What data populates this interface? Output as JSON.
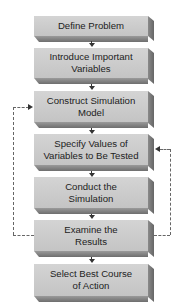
{
  "diagram": {
    "type": "flowchart",
    "steps": [
      {
        "line1": "Define Problem",
        "line2": ""
      },
      {
        "line1": "Introduce Important",
        "line2": "Variables"
      },
      {
        "line1": "Construct Simulation",
        "line2": "Model"
      },
      {
        "line1": "Specify Values of",
        "line2": "Variables to Be Tested"
      },
      {
        "line1": "Conduct the",
        "line2": "Simulation"
      },
      {
        "line1": "Examine the",
        "line2": "Results"
      },
      {
        "line1": "Select Best Course",
        "line2": "of Action"
      }
    ],
    "feedback_loops": [
      {
        "from": "Examine the Results",
        "to": "Construct Simulation Model",
        "side": "left",
        "style": "dashed"
      },
      {
        "from": "Examine the Results",
        "to": "Specify Values of Variables to Be Tested",
        "side": "right",
        "style": "dashed"
      }
    ],
    "colors": {
      "face": "#cccccc",
      "side": "#777777",
      "text": "#222222",
      "dashed_line": "#666666"
    }
  }
}
